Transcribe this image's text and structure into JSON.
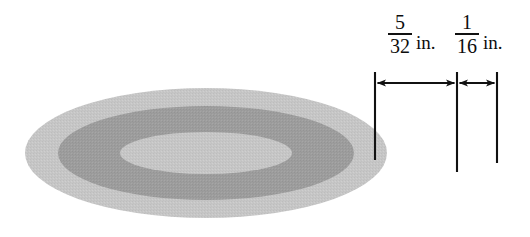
{
  "figure": {
    "shape": "annulus-ellipse",
    "colors": {
      "outer_ring": "#c3c3c3",
      "middle_ring": "#9b9b9b",
      "inner_disc": "#c3c3c3",
      "background": "#ffffff",
      "line": "#111111"
    },
    "ellipse": {
      "center_x": 206,
      "center_y": 153,
      "outer_rx": 181,
      "outer_ry": 65,
      "middle_rx": 148,
      "middle_ry": 47,
      "inner_rx": 86,
      "inner_ry": 21
    }
  },
  "dimensions": [
    {
      "id": "outer-band",
      "numerator": "5",
      "denominator": "32",
      "unit": "in.",
      "span_from_x": 375,
      "span_to_x": 457,
      "arrow_y": 83,
      "description": "Width of the dark middle band"
    },
    {
      "id": "rim",
      "numerator": "1",
      "denominator": "16",
      "unit": "in.",
      "span_from_x": 457,
      "span_to_x": 497,
      "arrow_y": 83,
      "description": "Width of the outer light rim"
    }
  ],
  "extension_lines": [
    {
      "id": "ext-left",
      "x": 375,
      "y_top": 72,
      "y_bottom": 160
    },
    {
      "id": "ext-middle",
      "x": 457,
      "y_top": 72,
      "y_bottom": 172
    },
    {
      "id": "ext-right",
      "x": 497,
      "y_top": 72,
      "y_bottom": 163
    }
  ]
}
